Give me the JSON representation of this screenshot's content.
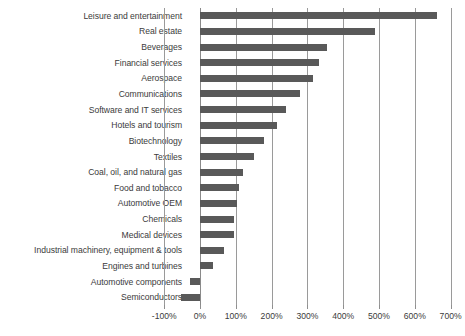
{
  "chart_data": {
    "type": "bar",
    "orientation": "horizontal",
    "title": "",
    "subtitle": "",
    "xlabel": "",
    "ylabel": "",
    "xlim": [
      -100,
      700
    ],
    "xticks": [
      -100,
      0,
      100,
      200,
      300,
      400,
      500,
      600,
      700
    ],
    "xtick_labels": [
      "-100%",
      "0%",
      "100%",
      "200%",
      "300%",
      "400%",
      "500%",
      "600%",
      "700%"
    ],
    "grid": "vertical",
    "legend": "none",
    "bar_color": "#595959",
    "gridline_color": "#9a9a9a",
    "categories": [
      "Leisure and entertainment",
      "Real estate",
      "Beverages",
      "Financial services",
      "Aerospace",
      "Communications",
      "Software and IT services",
      "Hotels and tourism",
      "Biotechnology",
      "Textiles",
      "Coal, oil, and natural gas",
      "Food and tobacco",
      "Automotive OEM",
      "Chemicals",
      "Medical devices",
      "Industrial machinery, equipment & tools",
      "Engines and turbines",
      "Automotive components",
      "Semiconductors"
    ],
    "values": [
      663,
      490,
      355,
      333,
      317,
      279,
      239,
      216,
      179,
      152,
      119,
      110,
      102,
      96,
      94,
      67,
      37,
      -28,
      -54
    ]
  }
}
